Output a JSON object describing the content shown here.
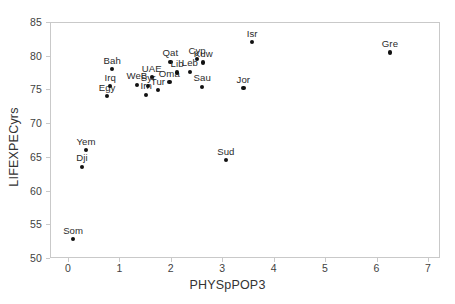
{
  "chart_data": {
    "type": "scatter",
    "title": "",
    "xlabel": "PHYSpPOP3",
    "ylabel": "LIFEXPECyrs",
    "xlim": [
      -0.35,
      7.25
    ],
    "ylim": [
      50,
      85
    ],
    "xticks": [
      0,
      1,
      2,
      3,
      4,
      5,
      6,
      7
    ],
    "yticks": [
      50,
      55,
      60,
      65,
      70,
      75,
      80,
      85
    ],
    "grid": false,
    "legend": null,
    "point_color": "#111111",
    "points": [
      {
        "label": "Som",
        "x": 0.1,
        "y": 52.8
      },
      {
        "label": "Dji",
        "x": 0.27,
        "y": 63.5
      },
      {
        "label": "Yem",
        "x": 0.35,
        "y": 66.0
      },
      {
        "label": "Egy",
        "x": 0.76,
        "y": 74.0
      },
      {
        "label": "Irq",
        "x": 0.82,
        "y": 75.5
      },
      {
        "label": "Bah",
        "x": 0.86,
        "y": 78.0
      },
      {
        "label": "WeB",
        "x": 1.34,
        "y": 75.7
      },
      {
        "label": "Irn",
        "x": 1.52,
        "y": 74.2
      },
      {
        "label": "Syr",
        "x": 1.56,
        "y": 75.5
      },
      {
        "label": "UAE",
        "x": 1.63,
        "y": 76.8
      },
      {
        "label": "Tur",
        "x": 1.75,
        "y": 74.9
      },
      {
        "label": "Oma",
        "x": 1.97,
        "y": 76.1
      },
      {
        "label": "Qat",
        "x": 1.99,
        "y": 79.1
      },
      {
        "label": "Lib",
        "x": 2.12,
        "y": 77.5
      },
      {
        "label": "Leb",
        "x": 2.37,
        "y": 77.6
      },
      {
        "label": "Cyp",
        "x": 2.51,
        "y": 79.5
      },
      {
        "label": "Kuw",
        "x": 2.63,
        "y": 79.0
      },
      {
        "label": "Sau",
        "x": 2.61,
        "y": 75.4
      },
      {
        "label": "Sud",
        "x": 3.07,
        "y": 64.5
      },
      {
        "label": "Jor",
        "x": 3.41,
        "y": 75.2
      },
      {
        "label": "Isr",
        "x": 3.58,
        "y": 82.0
      },
      {
        "label": "Gre",
        "x": 6.26,
        "y": 80.5
      }
    ]
  },
  "axes": {
    "x_title": "PHYSpPOP3",
    "y_title": "LIFEXPECyrs",
    "x_tick_labels": [
      "0",
      "1",
      "2",
      "3",
      "4",
      "5",
      "6",
      "7"
    ],
    "y_tick_labels": [
      "50",
      "55",
      "60",
      "65",
      "70",
      "75",
      "80",
      "85"
    ]
  }
}
